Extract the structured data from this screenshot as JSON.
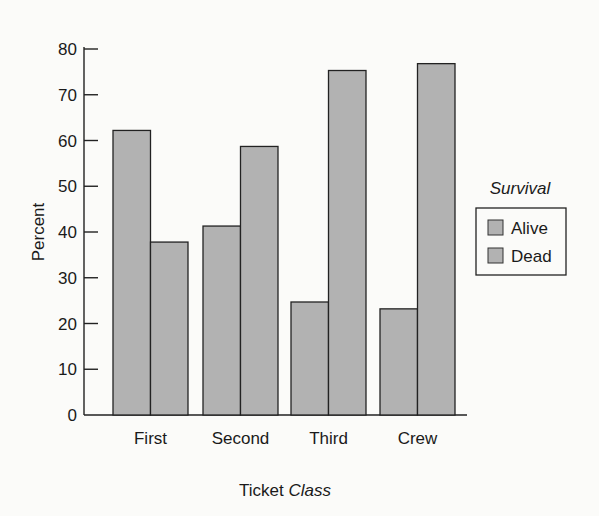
{
  "chart_data": {
    "type": "bar",
    "title": "",
    "xlabel": "Ticket Class",
    "xlabel_parts": [
      "Ticket ",
      "Class"
    ],
    "ylabel": "Percent",
    "ylim": [
      0,
      80
    ],
    "yticks": [
      0,
      10,
      20,
      30,
      40,
      50,
      60,
      70,
      80
    ],
    "categories": [
      "First",
      "Second",
      "Third",
      "Crew"
    ],
    "series": [
      {
        "name": "Alive",
        "values": [
          62.2,
          41.3,
          24.7,
          23.2
        ]
      },
      {
        "name": "Dead",
        "values": [
          37.8,
          58.7,
          75.3,
          76.8
        ]
      }
    ],
    "legend": {
      "title": "Survival",
      "position": "right",
      "entries": [
        "Alive",
        "Dead"
      ]
    },
    "grid": false,
    "bar_color": "#b2b2b2"
  }
}
